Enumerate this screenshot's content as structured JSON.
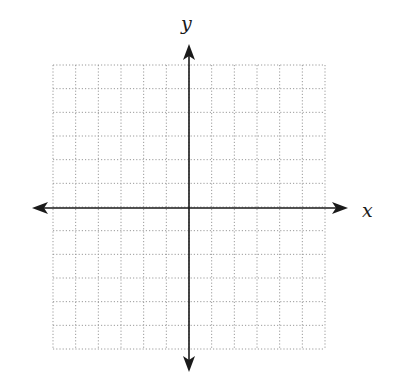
{
  "diagram": {
    "type": "coordinate-plane",
    "labels": {
      "x_axis": "x",
      "y_axis": "y"
    },
    "grid": {
      "left": 53,
      "top": 65,
      "right": 325,
      "bottom": 349,
      "columns": 12,
      "rows": 12,
      "line_color": "#9a9a9a",
      "line_style": "dotted"
    },
    "axes": {
      "color": "#1a1a1a",
      "origin": {
        "x": 189,
        "y": 208
      },
      "x_axis": {
        "start": 32,
        "end": 348
      },
      "y_axis": {
        "start": 44,
        "end": 372
      }
    }
  }
}
